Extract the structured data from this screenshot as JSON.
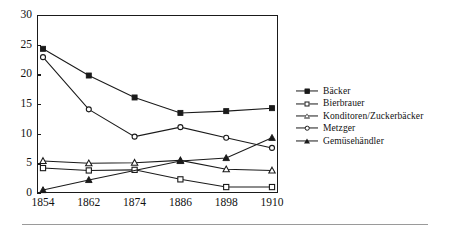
{
  "chart_data": {
    "type": "line",
    "title": "",
    "subtitle": "",
    "xlabel": "",
    "ylabel": "",
    "categories": [
      "1854",
      "1862",
      "1874",
      "1886",
      "1898",
      "1910"
    ],
    "ylim": [
      0,
      30
    ],
    "yticks": [
      "0",
      "5",
      "10",
      "15",
      "20",
      "25",
      "30"
    ],
    "ytick_values": [
      0,
      5,
      10,
      15,
      20,
      25,
      30
    ],
    "grid": false,
    "legend_position": "right",
    "line_color": "#1a1a1a",
    "series": [
      {
        "name": "Bäcker",
        "marker": "filled-square",
        "values": [
          24.3,
          19.8,
          16.1,
          13.5,
          13.8,
          14.3
        ]
      },
      {
        "name": "Bierbrauer",
        "marker": "open-square",
        "values": [
          4.2,
          3.8,
          3.9,
          2.3,
          1.0,
          1.0
        ]
      },
      {
        "name": "Konditoren/Zuckerbäcker",
        "marker": "open-triangle",
        "values": [
          5.4,
          5.0,
          5.1,
          5.5,
          4.0,
          3.8
        ]
      },
      {
        "name": "Metzger",
        "marker": "open-diamond",
        "values": [
          22.9,
          14.1,
          9.5,
          11.1,
          9.3,
          7.6
        ]
      },
      {
        "name": "Gemüsehändler",
        "marker": "filled-triangle",
        "values": [
          0.5,
          2.2,
          null,
          5.4,
          5.9,
          9.3
        ]
      }
    ]
  },
  "legend": {
    "items": [
      {
        "label": "Bäcker"
      },
      {
        "label": "Bierbrauer"
      },
      {
        "label": "Konditoren/Zuckerbäcker"
      },
      {
        "label": "Metzger"
      },
      {
        "label": "Gemüsehändler"
      }
    ]
  },
  "axes": {
    "y_labels": [
      "30",
      "25",
      "20",
      "15",
      "10",
      "5",
      "0"
    ],
    "x_labels": [
      "1854",
      "1862",
      "1874",
      "1886",
      "1898",
      "1910"
    ]
  }
}
